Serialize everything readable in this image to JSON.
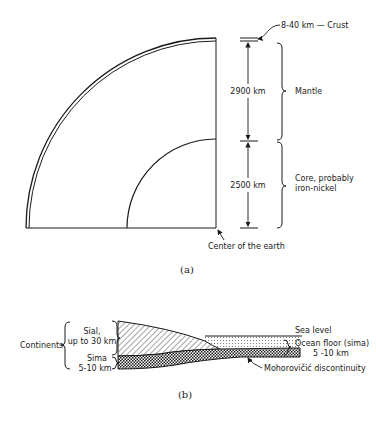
{
  "figure_a": {
    "caption": "(a)",
    "crust_label": "8-40 km — Crust",
    "mantle_thickness": "2900 km",
    "mantle_label": "Mantle",
    "core_thickness": "2500 km",
    "core_label_line1": "Core, probably",
    "core_label_line2": "iron-nickel",
    "center_label": "Center of the earth"
  },
  "figure_b": {
    "caption": "(b)",
    "continents_label": "Continents",
    "sial_line1": "Sial,",
    "sial_line2": "up to 30 km",
    "sima_line1": "Sima",
    "sima_line2": "5-10 km",
    "sea_level_label": "Sea level",
    "ocean_floor_line1": "Ocean floor (sima)",
    "ocean_floor_line2": "5 -10 km",
    "moho_label": "Mohorovičić discontinuity"
  }
}
